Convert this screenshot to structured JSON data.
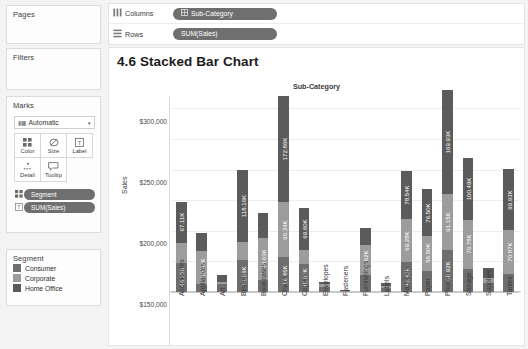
{
  "sidebar": {
    "pages": {
      "title": "Pages"
    },
    "filters": {
      "title": "Filters"
    },
    "marks": {
      "title": "Marks",
      "mark_type": {
        "label": "Automatic",
        "icon": "bar-mark-icon",
        "caret": "caret-down-icon"
      },
      "buttons": [
        {
          "label": "Color",
          "icon": "color-squares-icon"
        },
        {
          "label": "Size",
          "icon": "size-circle-icon"
        },
        {
          "label": "Label",
          "icon": "label-text-icon"
        },
        {
          "label": "Detail",
          "icon": "detail-dots-icon"
        },
        {
          "label": "Tooltip",
          "icon": "tooltip-bubble-icon"
        }
      ],
      "pills": [
        {
          "label": "Segment",
          "icon": "color-squares-icon"
        },
        {
          "label": "SUM(Sales)",
          "icon": "label-text-icon"
        }
      ]
    },
    "legend": {
      "title": "Segment",
      "items": [
        {
          "label": "Consumer",
          "color": "#6e6e6e"
        },
        {
          "label": "Corporate",
          "color": "#9c9c9c"
        },
        {
          "label": "Home Office",
          "color": "#5b5b5b"
        }
      ]
    }
  },
  "shelves": [
    {
      "name": "Columns",
      "icon": "columns-icon",
      "pill": {
        "label": "Sub-Category",
        "icon": "dimension-grid-icon"
      }
    },
    {
      "name": "Rows",
      "icon": "rows-icon",
      "pill": {
        "label": "SUM(Sales)",
        "icon": ""
      }
    }
  ],
  "viz": {
    "title": "4.6 Stacked Bar Chart",
    "column_header": "Sub-Category"
  },
  "chart_data": {
    "type": "bar",
    "title": "4.6 Stacked Bar Chart",
    "subtitle": "Sub-Category",
    "xlabel": "",
    "ylabel": "Sales",
    "ylim": [
      0,
      320000
    ],
    "yticks": [
      "$0",
      "$50,000",
      "$100,000",
      "$150,000",
      "$200,000",
      "$250,000",
      "$300,000"
    ],
    "ytick_values": [
      0,
      50000,
      100000,
      150000,
      200000,
      250000,
      300000
    ],
    "grid": true,
    "stacked": true,
    "legend_position": "left-panel",
    "categories": [
      "Accessories",
      "Appliances",
      "Art",
      "Binders",
      "Bookcases",
      "Chairs",
      "Copiers",
      "Envelopes",
      "Fasteners",
      "Furnishings",
      "Labels",
      "Machines",
      "Paper",
      "Phones",
      "Storage",
      "Supplies",
      "Tables"
    ],
    "series": [
      {
        "name": "Consumer",
        "color": "#6e6e6e",
        "values": [
          48150,
          13500,
          13000,
          51560,
          20000,
          56450,
          45830,
          8000,
          1500,
          27000,
          6500,
          49420,
          35000,
          68920,
          38000,
          14000,
          30000
        ],
        "labels": [
          "48.15K",
          "",
          "",
          "51.56K",
          "",
          "56.45K",
          "45.83K",
          "",
          "",
          "",
          "",
          "49.42K",
          "",
          "68.92K",
          "",
          "",
          ""
        ]
      },
      {
        "name": "Corporate",
        "color": "#9c9c9c",
        "values": [
          32000,
          52820,
          4000,
          30000,
          68630,
          90340,
          22000,
          5000,
          900,
          49620,
          4000,
          69280,
          56500,
          91150,
          79780,
          9000,
          70870
        ],
        "labels": [
          "",
          "52.82K",
          "",
          "",
          "68.63K",
          "90.34K",
          "",
          "",
          "",
          "49.62K",
          "",
          "69.28K",
          "56.50K",
          "91.15K",
          "79.78K",
          "",
          "70.87K"
        ]
      },
      {
        "name": "Home Office",
        "color": "#5b5b5b",
        "values": [
          67110,
          30000,
          10000,
          118160,
          40000,
          172860,
          69600,
          3000,
          600,
          28000,
          3500,
          78540,
          76500,
          169930,
          100490,
          16000,
          99930
        ],
        "labels": [
          "67.11K",
          "",
          "",
          "118.16K",
          "",
          "172.86K",
          "69.60K",
          "",
          "",
          "",
          "",
          "78.54K",
          "76.50K",
          "169.93K",
          "100.49K",
          "",
          "99.93K"
        ]
      }
    ]
  }
}
